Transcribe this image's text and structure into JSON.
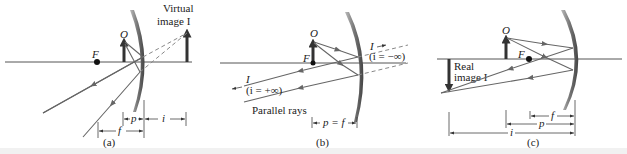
{
  "figure": {
    "colors": {
      "ray": "#666666",
      "object": "#333333",
      "mirror": "#555555",
      "axis": "#555555",
      "dashed": "#888888"
    }
  },
  "panels": [
    {
      "id": "a",
      "caption": "(a)",
      "labels": {
        "focal_point": "F",
        "object": "O",
        "image_title_line1": "Virtual",
        "image_title_line2": "image I",
        "dim_p": "p",
        "dim_i": "i",
        "dim_f": "f"
      }
    },
    {
      "id": "b",
      "caption": "(b)",
      "labels": {
        "focal_point": "F",
        "object": "O",
        "image_right": "I",
        "image_right_note": "(i = −∞)",
        "image_left": "I",
        "image_left_note": "(i = +∞)",
        "parallel_rays": "Parallel rays",
        "dim_pf": "p = f"
      }
    },
    {
      "id": "c",
      "caption": "(c)",
      "labels": {
        "focal_point": "F",
        "object": "O",
        "image_title_line1": "Real",
        "image_title_line2": "image I",
        "dim_f": "f",
        "dim_p": "p",
        "dim_i": "i"
      }
    }
  ]
}
